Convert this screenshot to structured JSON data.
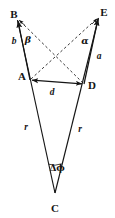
{
  "figure": {
    "width": 115,
    "height": 218,
    "background": "#ffffff",
    "stroke_color": "#151515",
    "text_color": "#151515"
  },
  "points": {
    "B": {
      "label": "B",
      "x": 14,
      "y": 14,
      "vertex_x": 17,
      "vertex_y": 19
    },
    "E": {
      "label": "E",
      "x": 104,
      "y": 12,
      "vertex_x": 99,
      "vertex_y": 17
    },
    "A": {
      "label": "A",
      "x": 22,
      "y": 76,
      "vertex_x": 30,
      "vertex_y": 80
    },
    "D": {
      "label": "D",
      "x": 92,
      "y": 85,
      "vertex_x": 84,
      "vertex_y": 84
    },
    "C": {
      "label": "C",
      "x": 55,
      "y": 208,
      "vertex_x": 55,
      "vertex_y": 193
    }
  },
  "segment_labels": {
    "b": {
      "label": "b",
      "x": 14,
      "y": 42
    },
    "a": {
      "label": "a",
      "x": 99,
      "y": 57
    },
    "d": {
      "label": "d",
      "x": 52,
      "y": 93
    },
    "r_left": {
      "label": "r",
      "x": 26,
      "y": 128
    },
    "r_right": {
      "label": "r",
      "x": 80,
      "y": 130
    }
  },
  "angle_labels": {
    "beta": {
      "label": "β",
      "x": 28,
      "y": 40
    },
    "alpha": {
      "label": "α",
      "x": 85,
      "y": 41
    },
    "delta_phi": {
      "label": "Δϕ",
      "x": 57,
      "y": 168
    }
  },
  "geometry": {
    "solid_lines": [
      {
        "name": "ray-A-to-B",
        "x1": 30,
        "y1": 80,
        "x2": 17,
        "y2": 19,
        "arrow": true
      },
      {
        "name": "ray-D-to-E",
        "x1": 84,
        "y1": 84,
        "x2": 99,
        "y2": 17,
        "arrow": true
      },
      {
        "name": "segment-A-D",
        "x1": 30,
        "y1": 80,
        "x2": 84,
        "y2": 84,
        "arrow": "both"
      },
      {
        "name": "radius-C-to-B-side",
        "x1": 55,
        "y1": 193,
        "x2": 17,
        "y2": 19,
        "arrow": false
      },
      {
        "name": "radius-C-to-E-side",
        "x1": 55,
        "y1": 193,
        "x2": 99,
        "y2": 17,
        "arrow": false
      }
    ],
    "dashed_lines": [
      {
        "name": "diagonal-A-to-E",
        "x1": 30,
        "y1": 80,
        "x2": 99,
        "y2": 17
      },
      {
        "name": "diagonal-D-to-B",
        "x1": 84,
        "y1": 84,
        "x2": 17,
        "y2": 19
      }
    ],
    "arc": {
      "name": "angle-arc-at-C",
      "cx": 55,
      "cy": 193,
      "radius": 30
    }
  }
}
